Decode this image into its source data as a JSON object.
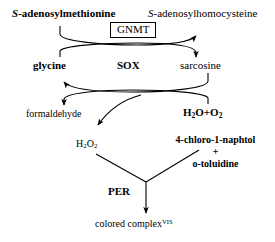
{
  "diagram": {
    "colors": {
      "background": "#ffffff",
      "stroke": "#000000",
      "text": "#000000"
    },
    "nodes": {
      "substrate_left": {
        "prefix": "S",
        "rest": "-adenosylmethionine",
        "full": "S-adenosylmethionine"
      },
      "product_right": {
        "prefix": "S",
        "rest": "-adenosylhomocysteine",
        "full": "S-adenosylhomocysteine"
      },
      "enzyme_1": "GNMT",
      "cosubstrate_left": "glycine",
      "enzyme_2": "SOX",
      "cosubstrate_right": "sarcosine",
      "byproduct_left": "formaldehyde",
      "cosubstrate_right_2": {
        "text": "H2O+O2",
        "part_h": "H",
        "sub_2a": "2",
        "part_o": "O+O",
        "sub_2b": "2"
      },
      "byproduct_left_2": {
        "text": "H2O2",
        "part_h": "H",
        "sub_2a": "2",
        "part_o": "O",
        "sub_2b": "2"
      },
      "chromogen_line1": "4-chloro-1-naphtol",
      "chromogen_plus": "+",
      "chromogen_line2": "o-toluidine",
      "enzyme_3": "PER",
      "final_product": {
        "text": "colored complex",
        "superscript": "VIS"
      }
    },
    "icons": {
      "arrow_head": "arrowhead-icon",
      "enzyme_box": "enzyme-box-icon"
    }
  }
}
